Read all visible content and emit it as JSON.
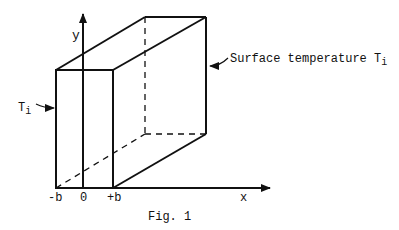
{
  "figure": {
    "caption": "Fig. 1",
    "axes": {
      "x_label": "x",
      "y_label": "y"
    },
    "ticks": {
      "minus_b": "-b",
      "zero": "0",
      "plus_b": "+b"
    },
    "annotations": {
      "left_face": {
        "text": "T",
        "subscript": "i"
      },
      "surface": {
        "text": "Surface temperature T",
        "subscript": "i"
      }
    },
    "colors": {
      "line": "#111111",
      "background": "#ffffff"
    }
  }
}
